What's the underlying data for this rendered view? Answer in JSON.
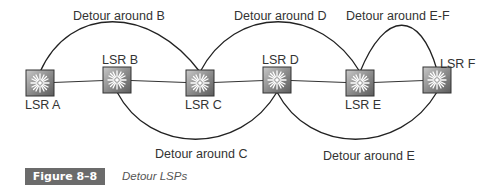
{
  "figure": {
    "number_label": "Figure 8–8",
    "caption": "Detour LSPs"
  },
  "routers": [
    {
      "id": "A",
      "label": "LSR A",
      "x": 40,
      "y": 83,
      "label_pos": "below"
    },
    {
      "id": "B",
      "label": "LSR B",
      "x": 117,
      "y": 80,
      "label_pos": "above"
    },
    {
      "id": "C",
      "label": "LSR C",
      "x": 200,
      "y": 83,
      "label_pos": "below"
    },
    {
      "id": "D",
      "label": "LSR D",
      "x": 277,
      "y": 80,
      "label_pos": "above"
    },
    {
      "id": "E",
      "label": "LSR E",
      "x": 360,
      "y": 83,
      "label_pos": "below"
    },
    {
      "id": "F",
      "label": "LSR F",
      "x": 437,
      "y": 80,
      "label_pos": "above"
    }
  ],
  "detours": [
    {
      "label": "Detour around B",
      "from": "A",
      "to": "C",
      "side": "top"
    },
    {
      "label": "Detour around C",
      "from": "B",
      "to": "D",
      "side": "bottom"
    },
    {
      "label": "Detour around D",
      "from": "C",
      "to": "E",
      "side": "top"
    },
    {
      "label": "Detour around E",
      "from": "D",
      "to": "F",
      "side": "bottom"
    },
    {
      "label": "Detour around E-F",
      "from": "E",
      "to": "F",
      "side": "top"
    }
  ]
}
